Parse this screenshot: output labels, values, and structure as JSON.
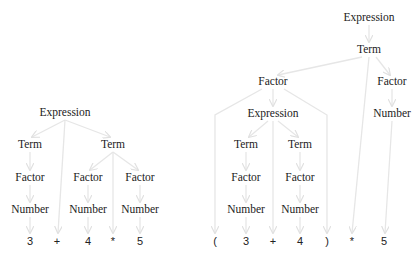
{
  "diagram": {
    "type": "parse-trees",
    "edge_color": "#e6e6e6",
    "trees": [
      {
        "name": "left-tree",
        "expression_text": "3 + 4 * 5",
        "nodes": [
          {
            "id": "L_expr",
            "label": "Expression",
            "x": 65,
            "y": 113
          },
          {
            "id": "L_term1",
            "label": "Term",
            "x": 30,
            "y": 145
          },
          {
            "id": "L_term2",
            "label": "Term",
            "x": 113,
            "y": 145
          },
          {
            "id": "L_fac1",
            "label": "Factor",
            "x": 30,
            "y": 178
          },
          {
            "id": "L_fac2",
            "label": "Factor",
            "x": 88,
            "y": 178
          },
          {
            "id": "L_fac3",
            "label": "Factor",
            "x": 140,
            "y": 178
          },
          {
            "id": "L_num1",
            "label": "Number",
            "x": 30,
            "y": 210
          },
          {
            "id": "L_num2",
            "label": "Number",
            "x": 88,
            "y": 210
          },
          {
            "id": "L_num3",
            "label": "Number",
            "x": 140,
            "y": 210
          }
        ],
        "tokens": [
          {
            "id": "L_t3",
            "label": "3",
            "x": 30,
            "y": 241
          },
          {
            "id": "L_tplus",
            "label": "+",
            "x": 57,
            "y": 241
          },
          {
            "id": "L_t4",
            "label": "4",
            "x": 88,
            "y": 241
          },
          {
            "id": "L_tstar",
            "label": "*",
            "x": 113,
            "y": 241
          },
          {
            "id": "L_t5",
            "label": "5",
            "x": 140,
            "y": 241
          }
        ]
      },
      {
        "name": "right-tree",
        "expression_text": "( 3 + 4 ) * 5",
        "nodes": [
          {
            "id": "R_expr",
            "label": "Expression",
            "x": 369,
            "y": 18
          },
          {
            "id": "R_term",
            "label": "Term",
            "x": 369,
            "y": 50
          },
          {
            "id": "R_fac1",
            "label": "Factor",
            "x": 273,
            "y": 82
          },
          {
            "id": "R_fac2",
            "label": "Factor",
            "x": 392,
            "y": 82
          },
          {
            "id": "R_expr2",
            "label": "Expression",
            "x": 273,
            "y": 114
          },
          {
            "id": "R_num3",
            "label": "Number",
            "x": 392,
            "y": 114
          },
          {
            "id": "R_term1",
            "label": "Term",
            "x": 246,
            "y": 145
          },
          {
            "id": "R_term2",
            "label": "Term",
            "x": 300,
            "y": 145
          },
          {
            "id": "R_fac3",
            "label": "Factor",
            "x": 246,
            "y": 178
          },
          {
            "id": "R_fac4",
            "label": "Factor",
            "x": 300,
            "y": 178
          },
          {
            "id": "R_num1",
            "label": "Number",
            "x": 246,
            "y": 210
          },
          {
            "id": "R_num2",
            "label": "Number",
            "x": 300,
            "y": 210
          }
        ],
        "tokens": [
          {
            "id": "R_tlp",
            "label": "(",
            "x": 215,
            "y": 241
          },
          {
            "id": "R_t3",
            "label": "3",
            "x": 246,
            "y": 241
          },
          {
            "id": "R_tplus",
            "label": "+",
            "x": 273,
            "y": 241
          },
          {
            "id": "R_t4",
            "label": "4",
            "x": 300,
            "y": 241
          },
          {
            "id": "R_trp",
            "label": ")",
            "x": 327,
            "y": 241
          },
          {
            "id": "R_tstar",
            "label": "*",
            "x": 352,
            "y": 241
          },
          {
            "id": "R_t5",
            "label": "5",
            "x": 384,
            "y": 241
          }
        ]
      }
    ],
    "edges": [
      [
        65,
        120,
        32,
        137
      ],
      [
        65,
        120,
        58,
        233
      ],
      [
        65,
        120,
        110,
        137
      ],
      [
        30,
        152,
        30,
        170
      ],
      [
        30,
        185,
        30,
        202
      ],
      [
        30,
        217,
        30,
        233
      ],
      [
        113,
        152,
        90,
        170
      ],
      [
        113,
        152,
        113,
        233
      ],
      [
        113,
        152,
        138,
        170
      ],
      [
        88,
        185,
        88,
        202
      ],
      [
        88,
        217,
        88,
        233
      ],
      [
        140,
        185,
        140,
        202
      ],
      [
        140,
        217,
        140,
        233
      ],
      [
        369,
        25,
        369,
        42
      ],
      [
        362,
        57,
        278,
        75
      ],
      [
        369,
        57,
        352,
        233
      ],
      [
        376,
        57,
        390,
        75
      ],
      [
        273,
        89,
        273,
        106
      ],
      [
        392,
        89,
        392,
        106
      ],
      [
        392,
        121,
        385,
        233
      ],
      [
        262,
        89,
        215,
        115,
        215,
        233
      ],
      [
        284,
        89,
        327,
        115,
        327,
        233
      ],
      [
        268,
        121,
        249,
        137
      ],
      [
        273,
        121,
        273,
        233
      ],
      [
        278,
        121,
        298,
        137
      ],
      [
        246,
        152,
        246,
        170
      ],
      [
        246,
        185,
        246,
        202
      ],
      [
        246,
        217,
        246,
        233
      ],
      [
        300,
        152,
        300,
        170
      ],
      [
        300,
        185,
        300,
        202
      ],
      [
        300,
        217,
        300,
        233
      ]
    ]
  }
}
